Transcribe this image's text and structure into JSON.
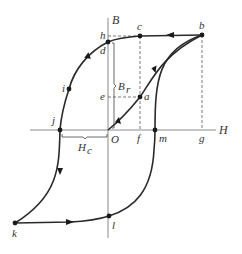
{
  "diagram": {
    "type": "magnetic-hysteresis-loop",
    "axes": {
      "vertical_label": "B",
      "horizontal_label": "H",
      "origin_label": "O"
    },
    "points": [
      {
        "id": "a",
        "label": "a",
        "x": 140,
        "y": 97
      },
      {
        "id": "b",
        "label": "b",
        "x": 202,
        "y": 35
      },
      {
        "id": "c",
        "label": "c",
        "x": 140,
        "y": 36
      },
      {
        "id": "d",
        "label": "d",
        "x": 108,
        "y": 42
      },
      {
        "id": "e",
        "label": "e",
        "x": 140,
        "y": 130
      },
      {
        "id": "f",
        "label": "f",
        "x": 108,
        "y": 97
      },
      {
        "id": "g",
        "label": "g",
        "x": 202,
        "y": 130
      },
      {
        "id": "h",
        "label": "h",
        "x": 108,
        "y": 36
      },
      {
        "id": "i",
        "label": "i",
        "x": 69,
        "y": 89
      },
      {
        "id": "j",
        "label": "j",
        "x": 60,
        "y": 130
      },
      {
        "id": "k",
        "label": "k",
        "x": 15,
        "y": 223
      },
      {
        "id": "l",
        "label": "l",
        "x": 109,
        "y": 216
      },
      {
        "id": "m",
        "label": "m",
        "x": 155,
        "y": 130
      }
    ],
    "annotations": {
      "remanence_label": "B",
      "remanence_subscript": "r",
      "coercivity_label": "H",
      "coercivity_subscript": "c"
    },
    "colors": {
      "curve": "#2a2a2a",
      "axis": "#8a8a8a",
      "text": "#333333",
      "background": "#ffffff"
    }
  }
}
